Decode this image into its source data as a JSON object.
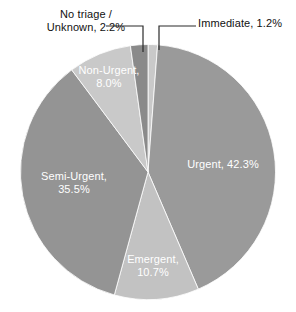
{
  "chart_data": {
    "type": "pie",
    "title": "",
    "subtitle": "",
    "xlabel": "",
    "ylabel": "",
    "legend_position": "none",
    "grid": false,
    "units": "percent",
    "start_angle_deg": 0,
    "direction": "clockwise",
    "categories": [
      "Immediate",
      "Urgent",
      "Emergent",
      "Semi-Urgent",
      "Non-Urgent",
      "No triage / Unknown"
    ],
    "values": [
      1.2,
      42.3,
      10.7,
      35.5,
      8.0,
      2.2
    ],
    "slices": [
      {
        "name": "Immediate",
        "value": 1.2,
        "value_text": "1.2%",
        "label_text": "Immediate, 1.2%",
        "color": "#c9c9c9",
        "label_placement": "outside",
        "label_color": "#111111"
      },
      {
        "name": "Urgent",
        "value": 42.3,
        "value_text": "42.3%",
        "label_text": "Urgent, 42.3%",
        "color": "#9a9a9a",
        "label_placement": "inside",
        "label_color": "#ffffff"
      },
      {
        "name": "Emergent",
        "value": 10.7,
        "value_text": "10.7%",
        "label_line1": "Emergent,",
        "label_line2": "10.7%",
        "color": "#c2c2c2",
        "label_placement": "inside",
        "label_color": "#ffffff"
      },
      {
        "name": "Semi-Urgent",
        "value": 35.5,
        "value_text": "35.5%",
        "label_line1": "Semi-Urgent,",
        "label_line2": "35.5%",
        "color": "#949494",
        "label_placement": "inside",
        "label_color": "#ffffff"
      },
      {
        "name": "Non-Urgent",
        "value": 8.0,
        "value_text": "8.0%",
        "label_line1": "Non-Urgent,",
        "label_line2": "8.0%",
        "color": "#c9c9c9",
        "label_placement": "inside",
        "label_color": "#ffffff"
      },
      {
        "name": "No triage / Unknown",
        "value": 2.2,
        "value_text": "2.2%",
        "label_line1": "No triage /",
        "label_line2": "Unknown, 2.2%",
        "color": "#8a8a8a",
        "label_placement": "outside",
        "label_color": "#111111"
      }
    ],
    "background_color": "#ffffff",
    "leader_line_color": "#2b2b2b"
  },
  "callouts": {
    "no_triage": {
      "line1": "No triage /",
      "line2": "Unknown, 2.2%"
    },
    "immediate": {
      "line1": "Immediate, 1.2%"
    }
  },
  "inside_labels": {
    "urgent": {
      "line1": "Urgent, 42.3%"
    },
    "semi_urgent": {
      "line1": "Semi-Urgent,",
      "line2": "35.5%"
    },
    "non_urgent": {
      "line1": "Non-Urgent,",
      "line2": "8.0%"
    },
    "emergent": {
      "line1": "Emergent,",
      "line2": "10.7%"
    }
  }
}
